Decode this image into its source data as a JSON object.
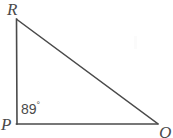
{
  "figure": {
    "kind": "geometry-diagram",
    "shape": "triangle",
    "background_color": "#ffffff",
    "stroke_color": "#4a4a4a",
    "text_color": "#4a4a4a",
    "canvas": {
      "width": 173,
      "height": 138
    },
    "vertices": [
      {
        "name": "R",
        "label": "R",
        "x": 16,
        "y": 19
      },
      {
        "name": "P",
        "label": "P",
        "x": 17,
        "y": 124
      },
      {
        "name": "Q",
        "label": "Q",
        "x": 157,
        "y": 124
      }
    ],
    "sides": [
      {
        "name": "RP",
        "from": "R",
        "to": "P"
      },
      {
        "name": "PQ",
        "from": "P",
        "to": "Q"
      },
      {
        "name": "RQ",
        "from": "R",
        "to": "Q"
      }
    ],
    "angles": [
      {
        "at_vertex": "P",
        "value": 89,
        "unit": "degrees",
        "text": "89",
        "degree_symbol": "°"
      }
    ]
  }
}
